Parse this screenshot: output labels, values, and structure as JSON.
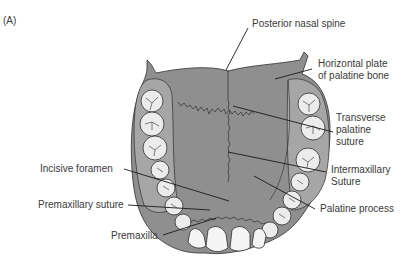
{
  "figure": {
    "panel_label": "(A)",
    "colors": {
      "palate_fill": "#8f8f8f",
      "alveolar_fill": "#a6a6a6",
      "tooth_fill": "#ececec",
      "outline": "#2e2e2e",
      "leader_line": "#1a1a1a",
      "label_text": "#3a3a3a"
    }
  },
  "labels": {
    "posterior_nasal_spine": "Posterior nasal spine",
    "horizontal_plate_line1": "Horizontal plate",
    "horizontal_plate_line2": "of palatine bone",
    "transverse_line1": "Transverse",
    "transverse_line2": "palatine",
    "transverse_line3": "suture",
    "intermaxillary_line1": "Intermaxillary",
    "intermaxillary_line2": "Suture",
    "palatine_process": "Palatine process",
    "incisive_foramen": "Incisive foramen",
    "premaxillary_suture": "Premaxillary suture",
    "premaxilla": "Premaxilla"
  }
}
